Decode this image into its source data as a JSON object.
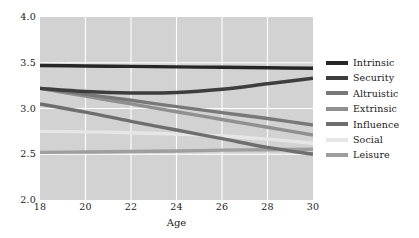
{
  "chart_data": {
    "type": "line",
    "title": "",
    "xlabel": "Age",
    "ylabel": "",
    "xlim": [
      18,
      30
    ],
    "ylim": [
      2.0,
      4.0
    ],
    "xticks": [
      18,
      20,
      22,
      24,
      26,
      28,
      30
    ],
    "xtick_labels": [
      "18",
      "20",
      "22",
      "24",
      "26",
      "28",
      "30"
    ],
    "yticks": [
      2.0,
      2.5,
      3.0,
      3.5,
      4.0
    ],
    "ytick_labels": [
      "2.0",
      "2.5",
      "3.0",
      "3.5",
      "4.0"
    ],
    "grid": true,
    "grid_color": "#ffffff",
    "plot_background": "#d2d2d2",
    "figure_background": "#ffffff",
    "legend_position": "right",
    "x": [
      18,
      20,
      22,
      24,
      26,
      28,
      30
    ],
    "series": [
      {
        "name": "Intrinsic",
        "color": "#262626",
        "values": [
          3.47,
          3.465,
          3.46,
          3.455,
          3.45,
          3.445,
          3.44
        ]
      },
      {
        "name": "Security",
        "color": "#3d3d3d",
        "values": [
          3.22,
          3.185,
          3.17,
          3.175,
          3.21,
          3.27,
          3.33
        ]
      },
      {
        "name": "Altruistic",
        "color": "#787878",
        "values": [
          3.22,
          3.155,
          3.09,
          3.02,
          2.955,
          2.89,
          2.82
        ]
      },
      {
        "name": "Extrinsic",
        "color": "#8f8f8f",
        "values": [
          3.22,
          3.135,
          3.05,
          2.965,
          2.88,
          2.795,
          2.71
        ]
      },
      {
        "name": "Influence",
        "color": "#6e6e6e",
        "values": [
          3.05,
          2.96,
          2.86,
          2.765,
          2.67,
          2.575,
          2.5
        ]
      },
      {
        "name": "Social",
        "color": "#e6e6e6",
        "values": [
          2.75,
          2.745,
          2.735,
          2.72,
          2.7,
          2.665,
          2.62
        ]
      },
      {
        "name": "Leisure",
        "color": "#9e9e9e",
        "values": [
          2.52,
          2.525,
          2.53,
          2.535,
          2.545,
          2.55,
          2.555
        ]
      }
    ]
  }
}
